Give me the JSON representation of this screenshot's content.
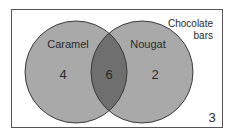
{
  "universe": {
    "label_line1": "Chocolate",
    "label_line2": "bars",
    "outside_count": "3"
  },
  "sets": [
    {
      "name": "Caramel",
      "only_count": "4"
    },
    {
      "name": "Nougat",
      "only_count": "2"
    }
  ],
  "intersection": {
    "count": "6"
  },
  "colors": {
    "circle_fill": "#a9a9a9",
    "intersection_fill": "#6f6f6f",
    "outline": "#3a3a3a",
    "border": "#555555"
  }
}
